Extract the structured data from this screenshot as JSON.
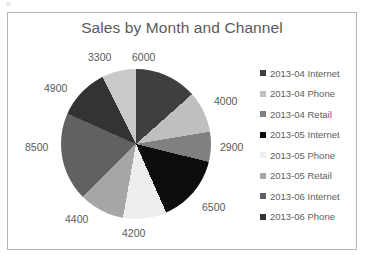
{
  "chart_data": {
    "type": "pie",
    "title": "Sales by Month and Channel",
    "xlabel": "",
    "ylabel": "",
    "legend_position": "right",
    "grid": false,
    "categories": [
      "2013-04 Internet",
      "2013-04 Phone",
      "2013-04 Retail",
      "2013-05 Internet",
      "2013-05 Phone",
      "2013-05 Retail",
      "2013-06 Internet",
      "2013-06 Phone",
      "2013-06 Retail"
    ],
    "values": [
      6000,
      4000,
      2900,
      6500,
      4200,
      4400,
      8500,
      4900,
      3300
    ],
    "colors": [
      "#3f3f3f",
      "#bfbfbf",
      "#808080",
      "#0d0d0d",
      "#ededed",
      "#a6a6a6",
      "#616161",
      "#333333",
      "#c9c9c9"
    ],
    "data_labels": [
      "6000",
      "4000",
      "2900",
      "6500",
      "4200",
      "4400",
      "8500",
      "4900",
      "3300"
    ],
    "total": 44700
  },
  "chart": {
    "title": "Sales by Month and Channel"
  },
  "labels": {
    "l0": "6000",
    "l1": "4000",
    "l2": "2900",
    "l3": "6500",
    "l4": "4200",
    "l5": "4400",
    "l6": "8500",
    "l7": "4900",
    "l8": "3300"
  },
  "legend": {
    "items": [
      {
        "label": "2013-04 Internet",
        "color": "#3f3f3f"
      },
      {
        "label": "2013-04 Phone",
        "color": "#bfbfbf"
      },
      {
        "label": "2013-04 Retail",
        "color": "#808080"
      },
      {
        "label": "2013-05 Internet",
        "color": "#0d0d0d"
      },
      {
        "label": "2013-05 Phone",
        "color": "#ededed"
      },
      {
        "label": "2013-05 Retail",
        "color": "#a6a6a6"
      },
      {
        "label": "2013-06 Internet",
        "color": "#616161"
      },
      {
        "label": "2013-06 Phone",
        "color": "#333333"
      }
    ]
  }
}
